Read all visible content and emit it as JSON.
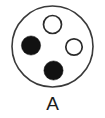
{
  "figure": {
    "caption": "A",
    "background_color": "#ffffff",
    "outline_color": "#3a3a3a",
    "filled_color": "#111111",
    "open_fill_color": "#ffffff"
  },
  "chart_data": {
    "type": "scatter",
    "title": "A",
    "xlabel": "",
    "ylabel": "",
    "xlim": [
      0,
      105
    ],
    "ylim": [
      0,
      96
    ],
    "grid": false,
    "legend": null,
    "annotations": [
      "A"
    ],
    "boundary": {
      "shape": "circle",
      "cx": 52.5,
      "cy": 46.5,
      "r": 40.5,
      "fill": "#ffffff",
      "stroke": "#3a3a3a",
      "stroke_width": 1.6
    },
    "series": [
      {
        "name": "open-circles",
        "marker": "open-circle",
        "fill": "#ffffff",
        "stroke": "#2b2b2b",
        "points": [
          {
            "id": "circle-top",
            "x": 52.5,
            "y": 24.5,
            "r": 9.0,
            "state": "open"
          },
          {
            "id": "circle-right",
            "x": 74.0,
            "y": 47.0,
            "r": 8.2,
            "state": "open"
          }
        ]
      },
      {
        "name": "filled-circles",
        "marker": "filled-circle",
        "fill": "#111111",
        "stroke": "#111111",
        "points": [
          {
            "id": "circle-left",
            "x": 31.0,
            "y": 45.5,
            "r": 9.6,
            "state": "filled"
          },
          {
            "id": "circle-bottom",
            "x": 53.5,
            "y": 70.5,
            "r": 9.6,
            "state": "filled"
          }
        ]
      }
    ]
  }
}
